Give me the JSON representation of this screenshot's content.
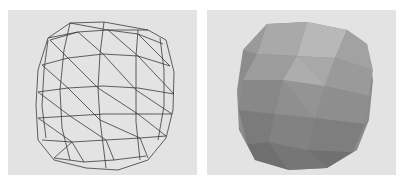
{
  "figure": {
    "panels": [
      {
        "id": "left",
        "content": "wireframe-mesh",
        "description": "Triangulated wireframe of a rounded cube-like blob"
      },
      {
        "id": "right",
        "content": "shaded-mesh",
        "description": "Flat-shaded polygonal rendering of the same rounded cube-like blob"
      }
    ],
    "colors": {
      "panel_background": "#e3e3e3",
      "wire": "#3a3a3a",
      "shade_light": "#b9b9b9",
      "shade_mid": "#989898",
      "shade_dark": "#6f6f6f"
    }
  }
}
